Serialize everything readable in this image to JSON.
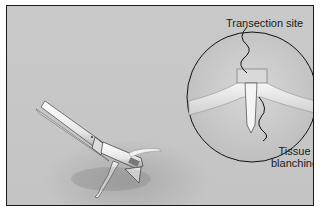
{
  "figure": {
    "colors": {
      "background": "#c6c6c6",
      "border": "#1a1a1a",
      "instrument": "#efefef"
    },
    "inset": {
      "labels": {
        "transection_site": "Transection site",
        "tissue_line1": "Tissue",
        "tissue_line2": "blanching"
      }
    }
  }
}
